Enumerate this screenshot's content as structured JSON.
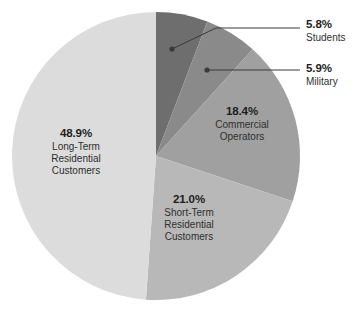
{
  "chart_data": {
    "type": "pie",
    "title": "",
    "subtitle": "",
    "xlabel": "",
    "ylabel": "",
    "grid": false,
    "legend_position": "none",
    "units": "percent",
    "start_angle_deg": 0,
    "direction": "clockwise",
    "center_px": [
      156,
      156
    ],
    "radius_px": 144,
    "categories": [
      "Students",
      "Military",
      "Commercial Operators",
      "Short-Term Residential Customers",
      "Long-Term Residential Customers"
    ],
    "values": [
      5.8,
      5.9,
      18.4,
      21.0,
      48.9
    ],
    "slices": [
      {
        "name": "Students",
        "value": 5.8,
        "pct_label": "5.8%",
        "name_lines": [
          "Students"
        ],
        "color": "#6e6e6e",
        "label_style": "callout",
        "start_deg": 0.0,
        "end_deg": 20.88
      },
      {
        "name": "Military",
        "value": 5.9,
        "pct_label": "5.9%",
        "name_lines": [
          "Military"
        ],
        "color": "#8a8a8a",
        "label_style": "callout",
        "start_deg": 20.88,
        "end_deg": 42.12
      },
      {
        "name": "Commercial Operators",
        "value": 18.4,
        "pct_label": "18.4%",
        "name_lines": [
          "Commercial",
          "Operators"
        ],
        "color": "#a0a0a0",
        "label_style": "inside",
        "start_deg": 42.12,
        "end_deg": 108.36
      },
      {
        "name": "Short-Term Residential Customers",
        "value": 21.0,
        "pct_label": "21.0%",
        "name_lines": [
          "Short-Term",
          "Residential",
          "Customers"
        ],
        "color": "#b8b8b8",
        "label_style": "inside",
        "start_deg": 108.36,
        "end_deg": 184.0
      },
      {
        "name": "Long-Term Residential Customers",
        "value": 48.9,
        "pct_label": "48.9%",
        "name_lines": [
          "Long-Term",
          "Residential",
          "Customers"
        ],
        "color": "#dcdcdc",
        "label_style": "inside",
        "start_deg": 184.0,
        "end_deg": 360.0
      }
    ],
    "callouts": [
      {
        "name": "Students",
        "dot_px": [
          172,
          49
        ],
        "elbow_px": [
          216,
          28
        ],
        "end_px": [
          300,
          28
        ],
        "line_color": "#3a3a3a"
      },
      {
        "name": "Military",
        "dot_px": [
          207,
          70
        ],
        "elbow_px": [
          207,
          70
        ],
        "end_px": [
          300,
          70
        ],
        "line_color": "#3a3a3a"
      }
    ],
    "colors": {
      "students": "#6e6e6e",
      "military": "#8a8a8a",
      "commercial_operators": "#a0a0a0",
      "short_term_residential": "#b8b8b8",
      "long_term_residential": "#dcdcdc",
      "background": "#ffffff",
      "text": "#2f2f2f",
      "text_bold": "#1d1d1d",
      "leader_line": "#3a3a3a"
    }
  }
}
